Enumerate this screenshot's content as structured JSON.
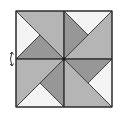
{
  "diagram": {
    "type": "pinwheel-quilt-square",
    "colors": {
      "light": "#f4f4f4",
      "medium": "#b5b5b5",
      "dark": "#979797",
      "outline": "#2e2e2e"
    },
    "rotation_arrow": "rotate-arrow-icon"
  }
}
